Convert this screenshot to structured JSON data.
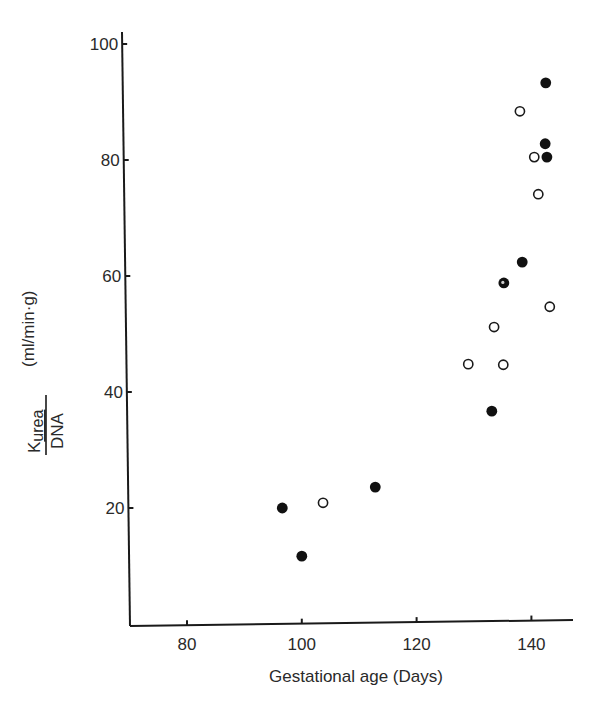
{
  "chart_data": {
    "type": "scatter",
    "title": "",
    "xlabel": "Gestational age  (Days)",
    "ylabel": {
      "numerator": "K",
      "numerator_subscript": "urea",
      "denominator": "DNA",
      "units": "(ml/min·g)"
    },
    "xlim": [
      70,
      147.5
    ],
    "ylim": [
      0,
      102
    ],
    "x_ticks": [
      80,
      100,
      120,
      140
    ],
    "y_ticks": [
      20,
      40,
      60,
      80,
      100
    ],
    "grid": false,
    "legend": null,
    "series": [
      {
        "name": "filled circles",
        "marker": "filled-circle",
        "points": [
          {
            "x": 96.6,
            "y": 20.0
          },
          {
            "x": 100.0,
            "y": 11.7
          },
          {
            "x": 112.8,
            "y": 23.6
          },
          {
            "x": 133.1,
            "y": 36.7
          },
          {
            "x": 138.4,
            "y": 62.4
          },
          {
            "x": 142.4,
            "y": 82.8
          },
          {
            "x": 142.7,
            "y": 80.5
          },
          {
            "x": 142.5,
            "y": 93.3
          }
        ]
      },
      {
        "name": "open circles",
        "marker": "open-circle",
        "points": [
          {
            "x": 103.7,
            "y": 20.9
          },
          {
            "x": 129.0,
            "y": 44.8
          },
          {
            "x": 135.1,
            "y": 44.7
          },
          {
            "x": 133.5,
            "y": 51.2
          },
          {
            "x": 143.2,
            "y": 54.7
          },
          {
            "x": 141.2,
            "y": 74.1
          },
          {
            "x": 140.5,
            "y": 80.5
          },
          {
            "x": 138.0,
            "y": 88.4
          }
        ]
      },
      {
        "name": "overlapping filled/open",
        "marker": "mixed-circle",
        "points": [
          {
            "x": 135.2,
            "y": 58.8
          }
        ]
      }
    ]
  },
  "axes": {
    "x_tick_labels": [
      "80",
      "100",
      "120",
      "140"
    ],
    "y_tick_labels": [
      "20",
      "40",
      "60",
      "80",
      "100"
    ],
    "x_title": "Gestational age  (Days)"
  },
  "colors": {
    "ink": "#1a1a1a",
    "background": "#ffffff"
  }
}
